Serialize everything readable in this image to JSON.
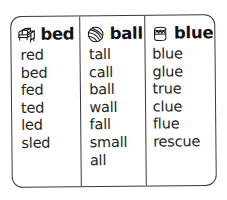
{
  "chart": {
    "frame_color": "#3a3a3a",
    "text_color": "#262626",
    "header_text_color": "#121212",
    "background_color": "#ffffff",
    "columns": [
      {
        "icon": "bed-icon",
        "header": "bed",
        "words": [
          "red",
          "bed",
          "fed",
          "ted",
          "led",
          "sled"
        ]
      },
      {
        "icon": "ball-icon",
        "header": "ball",
        "words": [
          "tall",
          "call",
          "ball",
          "wall",
          "fall",
          "small",
          "all"
        ]
      },
      {
        "icon": "paint-can-icon",
        "header": "blue",
        "words": [
          "blue",
          "glue",
          "true",
          "clue",
          "flue",
          "rescue"
        ]
      }
    ]
  }
}
